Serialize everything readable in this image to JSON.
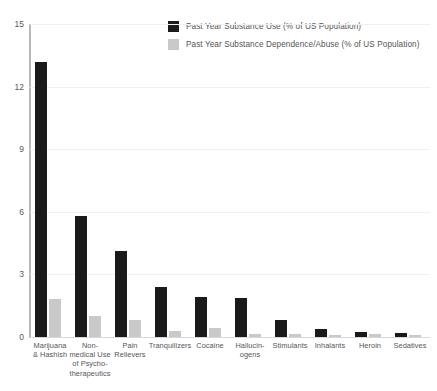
{
  "chart_data": {
    "type": "bar",
    "title": "",
    "subtitle": "",
    "xlabel": "",
    "ylabel": "",
    "ylim": [
      0,
      15
    ],
    "yticks": [
      0,
      3,
      6,
      9,
      12,
      15
    ],
    "grid": true,
    "legend_position": "top-right",
    "categories": [
      "Marijuana\n& Hashish",
      "Non-\nmedical Use\nof Psycho-\ntherapeutics",
      "Pain\nRelievers",
      "Tranquilizers",
      "Cocaine",
      "Hallucin-\nogens",
      "Stimulants",
      "Inhalants",
      "Heroin",
      "Sedatives"
    ],
    "series": [
      {
        "name": "Past Year Substance Use (% of US Population)",
        "color": "#1a1a1a",
        "values": [
          13.2,
          5.8,
          4.1,
          2.4,
          1.9,
          1.85,
          0.8,
          0.4,
          0.25,
          0.2
        ]
      },
      {
        "name": "Past Year Substance Dependence/Abuse (% of US Population)",
        "color": "#c9c9c9",
        "values": [
          1.8,
          1.0,
          0.8,
          0.3,
          0.45,
          0.15,
          0.15,
          0.1,
          0.15,
          0.1
        ]
      }
    ]
  },
  "legend": {
    "items": [
      {
        "label": "Past Year Substance Use (% of US Population)",
        "color": "#1a1a1a"
      },
      {
        "label": "Past Year Substance Dependence/Abuse (% of US Population)",
        "color": "#c9c9c9"
      }
    ]
  },
  "axis": {
    "y_tick_labels": [
      "15",
      "12",
      "9",
      "6",
      "3",
      "0"
    ]
  },
  "x_axis_labels": [
    [
      "Marijuana",
      "& Hashish"
    ],
    [
      "Non-",
      "medical Use",
      "of Psycho-",
      "therapeutics"
    ],
    [
      "Pain",
      "Relievers"
    ],
    [
      "Tranquilizers"
    ],
    [
      "Cocaine"
    ],
    [
      "Hallucin-",
      "ogens"
    ],
    [
      "Stimulants"
    ],
    [
      "Inhalants"
    ],
    [
      "Heroin"
    ],
    [
      "Sedatives"
    ]
  ]
}
